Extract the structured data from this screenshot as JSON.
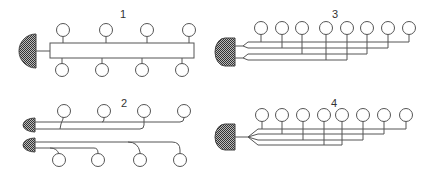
{
  "diagram": {
    "colors": {
      "stroke": "#555555",
      "fill_hatch_dark": "#444444",
      "fill_hatch_light": "#bbbbbb",
      "background": "#ffffff"
    },
    "panels": [
      {
        "id": "1",
        "label": "1",
        "type": "single box manifold",
        "outlets_top": 4,
        "outlets_bottom": 4
      },
      {
        "id": "2",
        "label": "2",
        "type": "two sources, individual curved branches",
        "outlets_top": 4,
        "outlets_bottom": 4
      },
      {
        "id": "3",
        "label": "3",
        "type": "two split feeders, parallel individual lines",
        "outlets_top": 8
      },
      {
        "id": "4",
        "label": "4",
        "type": "single feeder fanned into parallel individual lines",
        "outlets_top": 8
      }
    ]
  }
}
